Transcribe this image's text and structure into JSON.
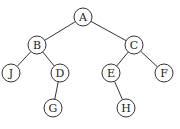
{
  "diagram": {
    "type": "binary-tree",
    "node_radius": 9,
    "nodes": [
      {
        "id": "A",
        "label": "A",
        "x": 83,
        "y": 17
      },
      {
        "id": "B",
        "label": "B",
        "x": 37,
        "y": 45
      },
      {
        "id": "C",
        "label": "C",
        "x": 134,
        "y": 45
      },
      {
        "id": "J",
        "label": "J",
        "x": 11,
        "y": 73
      },
      {
        "id": "D",
        "label": "D",
        "x": 60,
        "y": 73
      },
      {
        "id": "E",
        "label": "E",
        "x": 111,
        "y": 73
      },
      {
        "id": "F",
        "label": "F",
        "x": 164,
        "y": 73
      },
      {
        "id": "G",
        "label": "G",
        "x": 53,
        "y": 108
      },
      {
        "id": "H",
        "label": "H",
        "x": 126,
        "y": 108
      }
    ],
    "edges": [
      {
        "from": "A",
        "to": "B"
      },
      {
        "from": "A",
        "to": "C"
      },
      {
        "from": "B",
        "to": "J"
      },
      {
        "from": "B",
        "to": "D"
      },
      {
        "from": "C",
        "to": "E"
      },
      {
        "from": "C",
        "to": "F"
      },
      {
        "from": "D",
        "to": "G"
      },
      {
        "from": "E",
        "to": "H"
      }
    ]
  }
}
